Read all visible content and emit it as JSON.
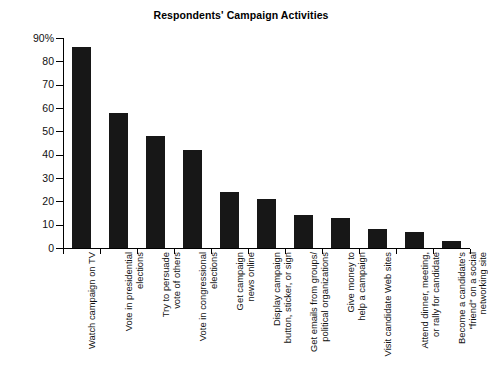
{
  "chart_data": {
    "type": "bar",
    "title": "Respondents' Campaign Activities",
    "xlabel": "",
    "ylabel": "",
    "ylim": [
      0,
      90
    ],
    "grid": false,
    "legend": null,
    "ytick_labels": [
      "90%",
      "80",
      "70",
      "60",
      "50",
      "40",
      "30",
      "20",
      "10",
      "0"
    ],
    "ytick_values": [
      90,
      80,
      70,
      60,
      50,
      40,
      30,
      20,
      10,
      0
    ],
    "bar_color": "#171717",
    "categories": [
      "Watch campaign on TV",
      "Vote in presidential elections",
      "Try to persuade vote of others",
      "Vote in congressional elections",
      "Get campaign news online",
      "Display campaign button, sticker, or sign",
      "Get emails from groups/ political organizations",
      "Give money to help a campaign",
      "Visit candidate Web sites",
      "Attend dinner, meeting, or rally for candidate",
      "Become a candidate's \"friend\" on a social networking site"
    ],
    "category_lines": [
      [
        "Watch campaign on TV"
      ],
      [
        "Vote in presidential",
        "elections"
      ],
      [
        "Try to persuade",
        "vote of others"
      ],
      [
        "Vote in congressional",
        "elections"
      ],
      [
        "Get campaign",
        "news online"
      ],
      [
        "Display campaign",
        "button, sticker, or sign"
      ],
      [
        "Get emails from groups/",
        "political organizations"
      ],
      [
        "Give money to",
        "help a campaign"
      ],
      [
        "Visit candidate Web sites"
      ],
      [
        "Attend dinner, meeting,",
        "or rally for candidate"
      ],
      [
        "Become a candidate's",
        "\"friend\" on a social",
        "networking site"
      ]
    ],
    "values": [
      86,
      58,
      48,
      42,
      24,
      21,
      14,
      13,
      8,
      7,
      3
    ]
  }
}
